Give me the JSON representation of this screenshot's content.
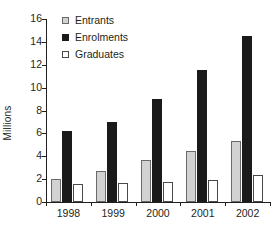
{
  "chart_data": {
    "type": "bar",
    "title": "",
    "subtitle": "",
    "xlabel": "",
    "ylabel": "Millions",
    "categories": [
      "1998",
      "1999",
      "2000",
      "2001",
      "2002"
    ],
    "series": [
      {
        "name": "Entrants",
        "color": "#d2d2d2",
        "values": [
          2.0,
          2.7,
          3.7,
          4.45,
          5.3
        ]
      },
      {
        "name": "Enrolments",
        "color": "#1a1a1a",
        "values": [
          6.2,
          7.0,
          9.0,
          11.5,
          14.5
        ]
      },
      {
        "name": "Graduates",
        "color": "#ffffff",
        "values": [
          1.6,
          1.65,
          1.75,
          1.9,
          2.4
        ]
      }
    ],
    "ylim": [
      0,
      16
    ],
    "yticks": [
      "0",
      "2",
      "4",
      "6",
      "8",
      "10",
      "12",
      "14",
      "16"
    ],
    "grid": false,
    "legend_position": "top-left"
  }
}
